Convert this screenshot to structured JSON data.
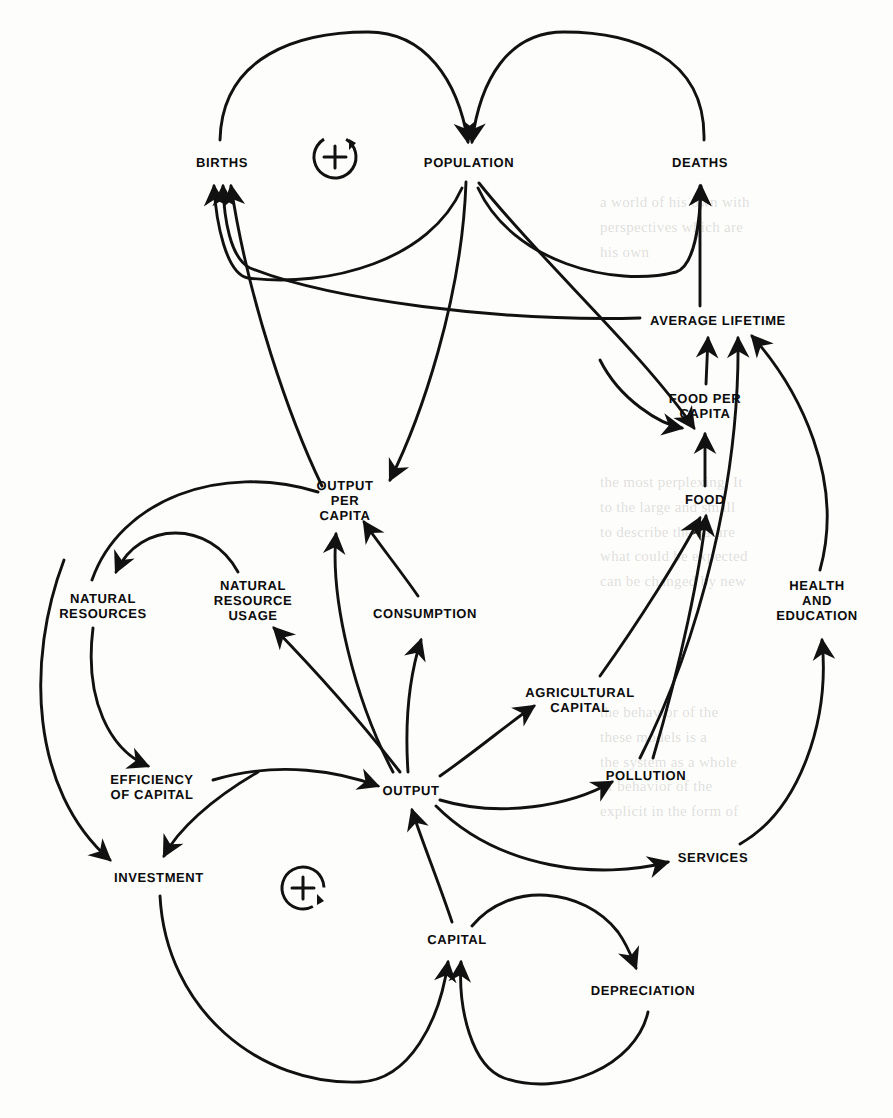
{
  "diagram": {
    "type": "causal-loop-diagram",
    "stroke_color": "#111111",
    "background_color": "#fdfdfc",
    "width": 893,
    "height": 1118,
    "nodes": [
      {
        "id": "births",
        "label": "BIRTHS",
        "x": 222,
        "y": 163
      },
      {
        "id": "population",
        "label": "POPULATION",
        "x": 469,
        "y": 163
      },
      {
        "id": "deaths",
        "label": "DEATHS",
        "x": 700,
        "y": 163
      },
      {
        "id": "average_lifetime",
        "label": "AVERAGE LIFETIME",
        "x": 718,
        "y": 321
      },
      {
        "id": "food_per_capita",
        "label": "FOOD PER\nCAPITA",
        "x": 705,
        "y": 406
      },
      {
        "id": "food",
        "label": "FOOD",
        "x": 705,
        "y": 500
      },
      {
        "id": "output_per_capita",
        "label": "OUTPUT\nPER\nCAPITA",
        "x": 345,
        "y": 501
      },
      {
        "id": "natural_resources",
        "label": "NATURAL\nRESOURCES",
        "x": 103,
        "y": 606
      },
      {
        "id": "natural_resource_usage",
        "label": "NATURAL\nRESOURCE\nUSAGE",
        "x": 253,
        "y": 601
      },
      {
        "id": "consumption",
        "label": "CONSUMPTION",
        "x": 425,
        "y": 614
      },
      {
        "id": "health_education",
        "label": "HEALTH\nAND\nEDUCATION",
        "x": 817,
        "y": 601
      },
      {
        "id": "agricultural_capital",
        "label": "AGRICULTURAL\nCAPITAL",
        "x": 580,
        "y": 700
      },
      {
        "id": "pollution",
        "label": "POLLUTION",
        "x": 646,
        "y": 776
      },
      {
        "id": "efficiency_of_capital",
        "label": "EFFICIENCY\nOF CAPITAL",
        "x": 152,
        "y": 787
      },
      {
        "id": "output",
        "label": "OUTPUT",
        "x": 411,
        "y": 791
      },
      {
        "id": "services",
        "label": "SERVICES",
        "x": 713,
        "y": 858
      },
      {
        "id": "investment",
        "label": "INVESTMENT",
        "x": 159,
        "y": 878
      },
      {
        "id": "capital",
        "label": "CAPITAL",
        "x": 457,
        "y": 940
      },
      {
        "id": "depreciation",
        "label": "DEPRECIATION",
        "x": 643,
        "y": 991
      }
    ],
    "loop_markers": [
      {
        "id": "loop-positive-population",
        "symbol": "+",
        "polarity": "positive",
        "direction": "clockwise",
        "x": 335,
        "y": 157,
        "r": 22
      },
      {
        "id": "loop-positive-capital",
        "symbol": "+",
        "polarity": "positive",
        "direction": "clockwise",
        "x": 303,
        "y": 888,
        "r": 22
      }
    ],
    "edges": [
      {
        "from": "births",
        "to": "population",
        "label": ""
      },
      {
        "from": "population",
        "to": "births",
        "label": ""
      },
      {
        "from": "population",
        "to": "deaths",
        "label": ""
      },
      {
        "from": "deaths",
        "to": "population",
        "label": ""
      },
      {
        "from": "average_lifetime",
        "to": "births",
        "label": ""
      },
      {
        "from": "average_lifetime",
        "to": "deaths",
        "label": ""
      },
      {
        "from": "population",
        "to": "output_per_capita",
        "label": ""
      },
      {
        "from": "population",
        "to": "food_per_capita",
        "label": ""
      },
      {
        "from": "food_per_capita",
        "to": "average_lifetime",
        "label": ""
      },
      {
        "from": "food",
        "to": "food_per_capita",
        "label": ""
      },
      {
        "from": "agricultural_capital",
        "to": "food",
        "label": ""
      },
      {
        "from": "pollution",
        "to": "average_lifetime",
        "label": ""
      },
      {
        "from": "pollution",
        "to": "food",
        "label": ""
      },
      {
        "from": "health_education",
        "to": "average_lifetime",
        "label": ""
      },
      {
        "from": "services",
        "to": "health_education",
        "label": ""
      },
      {
        "from": "output",
        "to": "agricultural_capital",
        "label": ""
      },
      {
        "from": "output",
        "to": "pollution",
        "label": ""
      },
      {
        "from": "output",
        "to": "services",
        "label": ""
      },
      {
        "from": "output",
        "to": "consumption",
        "label": ""
      },
      {
        "from": "output",
        "to": "natural_resource_usage",
        "label": ""
      },
      {
        "from": "output",
        "to": "investment",
        "label": ""
      },
      {
        "from": "consumption",
        "to": "output_per_capita",
        "label": ""
      },
      {
        "from": "output",
        "to": "output_per_capita",
        "label": ""
      },
      {
        "from": "natural_resource_usage",
        "to": "natural_resources",
        "label": ""
      },
      {
        "from": "natural_resources",
        "to": "efficiency_of_capital",
        "label": ""
      },
      {
        "from": "efficiency_of_capital",
        "to": "output",
        "label": ""
      },
      {
        "from": "efficiency_of_capital",
        "to": "investment",
        "label": ""
      },
      {
        "from": "investment",
        "to": "capital",
        "label": ""
      },
      {
        "from": "capital",
        "to": "output",
        "label": ""
      },
      {
        "from": "capital",
        "to": "depreciation",
        "label": ""
      },
      {
        "from": "depreciation",
        "to": "capital",
        "label": ""
      },
      {
        "from": "output_per_capita",
        "to": "births",
        "label": ""
      }
    ]
  },
  "ghost_text": {
    "note": "faint show-through of printed text from the reverse side of the page",
    "lines": [
      "a world of his own with",
      "perspectives which are",
      "his own",
      "the most perplexing. It",
      "to the large and small",
      "to describe the nature",
      "what could be expected",
      "can be changed by new",
      "the behavior of the",
      "these models is a",
      "the system as a whole",
      "of behavior of the",
      "explicit in the form of"
    ]
  }
}
